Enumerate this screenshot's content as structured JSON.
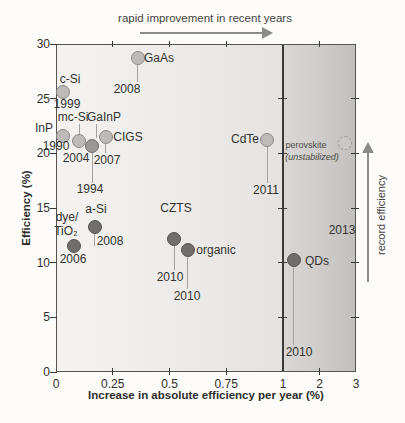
{
  "annotations": {
    "top": "rapid improvement in recent years",
    "right": "record efficiency"
  },
  "chart_data": {
    "type": "scatter",
    "title": "",
    "xlabel": "Increase in absolute efficiency per year (%)",
    "ylabel": "Efficiency (%)",
    "x_axis": {
      "note": "piecewise scale: 0 to 1 expanded, 1 to 3 compressed",
      "ticks": [
        {
          "value": 0,
          "label": "0"
        },
        {
          "value": 0.25,
          "label": "0.25"
        },
        {
          "value": 0.5,
          "label": "0.5"
        },
        {
          "value": 0.75,
          "label": "0.75"
        },
        {
          "value": 1,
          "label": "1"
        },
        {
          "value": 2,
          "label": "2"
        },
        {
          "value": 3,
          "label": "3"
        }
      ],
      "minor_tick_values": [
        0.25,
        0.5,
        0.75,
        2
      ]
    },
    "y_axis": {
      "range": [
        0,
        30
      ],
      "ticks": [
        {
          "value": 30,
          "label": "30"
        },
        {
          "value": 25,
          "label": "25"
        },
        {
          "value": 20,
          "label": "20"
        },
        {
          "value": 15,
          "label": "15"
        },
        {
          "value": 10,
          "label": "10"
        },
        {
          "value": 5,
          "label": "5"
        },
        {
          "value": 0,
          "label": "0"
        }
      ]
    },
    "divider_x": 1,
    "shaded_region_x": [
      1,
      3
    ],
    "points": [
      {
        "name": "c-Si",
        "year": "1999",
        "x": 0.03,
        "y": 25.6,
        "shade": "light",
        "label_lines": [
          {
            "text": "c-Si",
            "px": [
              70,
              79
            ]
          }
        ],
        "year_px": [
          67,
          104
        ]
      },
      {
        "name": "InP",
        "year": "1990",
        "x": 0.03,
        "y": 21.6,
        "shade": "light",
        "label_lines": [
          {
            "text": "InP",
            "px": [
              44,
              128
            ]
          }
        ],
        "year_px": [
          56,
          146
        ]
      },
      {
        "name": "mc-Si",
        "year": "2004",
        "x": 0.1,
        "y": 21.1,
        "shade": "light",
        "label_lines": [
          {
            "text": "mc-Si",
            "px": [
              73,
              117
            ]
          }
        ],
        "year_px": [
          76,
          158
        ],
        "leader": {
          "x": 79,
          "y1": 124,
          "y2": 134
        }
      },
      {
        "name": "GaInP",
        "year": "1994",
        "x": 0.16,
        "y": 20.7,
        "shade": "medium",
        "label_lines": [
          {
            "text": "GaInP",
            "px": [
              104,
              117
            ]
          }
        ],
        "year_px": [
          90,
          189
        ],
        "stem_end_y": 183,
        "leader": {
          "x": 96,
          "y1": 124,
          "y2": 138
        }
      },
      {
        "name": "CIGS",
        "year": "2007",
        "x": 0.22,
        "y": 21.5,
        "shade": "light",
        "label_lines": [
          {
            "text": "CIGS",
            "px": [
              128,
              137
            ]
          }
        ],
        "year_px": [
          107,
          160
        ],
        "stem_end_y": 153
      },
      {
        "name": "GaAs",
        "year": "2008",
        "x": 0.36,
        "y": 28.7,
        "shade": "light",
        "label_lines": [
          {
            "text": "GaAs",
            "px": [
              159,
              58
            ]
          }
        ],
        "year_px": [
          127,
          89
        ],
        "stem_end_y": 82
      },
      {
        "name": "CdTe",
        "year": "2011",
        "x": 0.93,
        "y": 21.2,
        "shade": "light",
        "label_lines": [
          {
            "text": "CdTe",
            "px": [
              245,
              139
            ]
          }
        ],
        "year_px": [
          266,
          190
        ],
        "stem_end_y": 183
      },
      {
        "name": "a-Si",
        "year": "2008",
        "x": 0.17,
        "y": 13.3,
        "shade": "dark",
        "label_lines": [
          {
            "text": "a-Si",
            "px": [
              96,
              209
            ]
          }
        ],
        "year_px": [
          110,
          241
        ],
        "stem_end_y": 246
      },
      {
        "name": "dye/TiO2",
        "year": "2006",
        "x": 0.08,
        "y": 11.5,
        "shade": "dark",
        "label_lines": [
          {
            "text": "dye/",
            "px": [
              67,
              217
            ]
          },
          {
            "text": "TiO₂",
            "px": [
              66,
              231
            ]
          }
        ],
        "year_px": [
          73,
          259
        ]
      },
      {
        "name": "CZTS",
        "year": "2010",
        "x": 0.52,
        "y": 12.2,
        "shade": "dark",
        "label_lines": [
          {
            "text": "CZTS",
            "px": [
              176,
              208
            ]
          }
        ],
        "year_px": [
          170,
          277
        ],
        "stem_end_y": 270
      },
      {
        "name": "organic",
        "year": "2010",
        "x": 0.58,
        "y": 11.2,
        "shade": "dark",
        "label_lines": [
          {
            "text": "organic",
            "px": [
              216,
              250
            ]
          }
        ],
        "year_px": [
          187,
          296
        ],
        "stem_end_y": 289
      },
      {
        "name": "QDs",
        "year": "2010",
        "x": 1.3,
        "y": 10.2,
        "shade": "dark",
        "label_lines": [
          {
            "text": "QDs",
            "px": [
              317,
              261
            ]
          }
        ],
        "year_px": [
          299,
          352
        ],
        "stem_end_y": 345
      },
      {
        "name": "perovskite (unstabilized)",
        "year": "2013",
        "x": 2.7,
        "y": 20.9,
        "shade": "dashed",
        "label_lines": [
          {
            "text": "perovskite",
            "px": [
              306,
              146
            ],
            "small": true
          },
          {
            "text": "(unstabilized)",
            "px": [
              312,
              158
            ],
            "small": true,
            "italic": true
          }
        ],
        "year_px": [
          342,
          230
        ]
      }
    ]
  },
  "colors": {
    "light_fill": "#bcbbb9",
    "light_edge": "#8b8a88",
    "medium_fill": "#999896",
    "medium_edge": "#6f6e6c",
    "dark_fill": "#6f6e6c",
    "dark_edge": "#555453",
    "dashed_edge": "#9a9997",
    "stem": "#a3a2a0",
    "arrow": "#8c8b89",
    "divider": "#3b3a38",
    "plot_border": "#55544f",
    "zone_left_bg_start": "#f4f3f1",
    "zone_left_bg_end": "#e4e3e1",
    "zone_right_bg_start": "#d9d8d6",
    "zone_right_bg_end": "#c1c0be",
    "text": "#33322f"
  }
}
